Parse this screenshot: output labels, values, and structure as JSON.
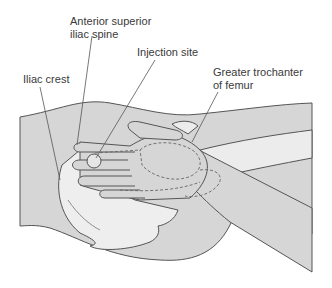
{
  "diagram": {
    "labels": [
      {
        "id": "asis",
        "lines": [
          "Anterior superior",
          "iliac spine"
        ]
      },
      {
        "id": "injection",
        "lines": [
          "Injection site"
        ]
      },
      {
        "id": "iliac_crest",
        "lines": [
          "Iliac crest"
        ]
      },
      {
        "id": "trochanter",
        "lines": [
          "Greater trochanter",
          "of femur"
        ]
      }
    ],
    "colors": {
      "background": "#ffffff",
      "body_fill": "#d6d6d6",
      "light_fill": "#ececec",
      "bone_fill": "#eeeeee",
      "outline": "#555555",
      "label_text": "#3a3a3a"
    }
  }
}
